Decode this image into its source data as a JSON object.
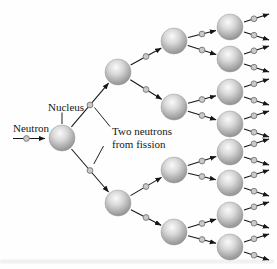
{
  "canvas": {
    "width": 277,
    "height": 269,
    "background": "#fefefe"
  },
  "labels": {
    "neutron": "Neutron",
    "nucleus": "Nucleus",
    "fission_line1": "Two neutrons",
    "fission_line2": "from fission"
  },
  "colors": {
    "arrow": "#161616",
    "text": "#161616",
    "sphere_highlight": "#fafafa",
    "sphere_light": "#d9d9d9",
    "sphere_mid": "#aeaeae",
    "sphere_edge": "#8b8b8b",
    "sphere_rim": "#9a9a9a",
    "neutron_dot_fill": "#c9c9c9",
    "neutron_dot_stroke": "#767676",
    "page_artifact": "#ececec"
  },
  "diagram": {
    "spheres": [
      {
        "id": "gen1",
        "generation": 1,
        "x": 62,
        "y": 138,
        "r": 13
      },
      {
        "id": "gen2a",
        "generation": 2,
        "x": 118,
        "y": 72,
        "r": 13
      },
      {
        "id": "gen2b",
        "generation": 2,
        "x": 118,
        "y": 203,
        "r": 13
      },
      {
        "id": "gen3a",
        "generation": 3,
        "x": 174,
        "y": 41,
        "r": 13
      },
      {
        "id": "gen3b",
        "generation": 3,
        "x": 174,
        "y": 107,
        "r": 13
      },
      {
        "id": "gen3c",
        "generation": 3,
        "x": 174,
        "y": 170,
        "r": 13
      },
      {
        "id": "gen3d",
        "generation": 3,
        "x": 174,
        "y": 232,
        "r": 13
      },
      {
        "id": "gen4a",
        "generation": 4,
        "x": 230,
        "y": 27,
        "r": 13
      },
      {
        "id": "gen4b",
        "generation": 4,
        "x": 230,
        "y": 59,
        "r": 13
      },
      {
        "id": "gen4c",
        "generation": 4,
        "x": 230,
        "y": 92,
        "r": 13
      },
      {
        "id": "gen4d",
        "generation": 4,
        "x": 230,
        "y": 124,
        "r": 13
      },
      {
        "id": "gen4e",
        "generation": 4,
        "x": 230,
        "y": 152,
        "r": 13
      },
      {
        "id": "gen4f",
        "generation": 4,
        "x": 230,
        "y": 183,
        "r": 13
      },
      {
        "id": "gen4g",
        "generation": 4,
        "x": 230,
        "y": 215,
        "r": 13
      },
      {
        "id": "gen4h",
        "generation": 4,
        "x": 230,
        "y": 247,
        "r": 13
      }
    ],
    "links": [
      {
        "from": "gen1",
        "to": "gen2a"
      },
      {
        "from": "gen1",
        "to": "gen2b"
      },
      {
        "from": "gen2a",
        "to": "gen3a"
      },
      {
        "from": "gen2a",
        "to": "gen3b"
      },
      {
        "from": "gen2b",
        "to": "gen3c"
      },
      {
        "from": "gen2b",
        "to": "gen3d"
      },
      {
        "from": "gen3a",
        "to": "gen4a"
      },
      {
        "from": "gen3a",
        "to": "gen4b"
      },
      {
        "from": "gen3b",
        "to": "gen4c"
      },
      {
        "from": "gen3b",
        "to": "gen4d"
      },
      {
        "from": "gen3c",
        "to": "gen4e"
      },
      {
        "from": "gen3c",
        "to": "gen4f"
      },
      {
        "from": "gen3d",
        "to": "gen4g"
      },
      {
        "from": "gen3d",
        "to": "gen4h"
      }
    ],
    "exit_sphere_ids": [
      "gen4a",
      "gen4b",
      "gen4c",
      "gen4d",
      "gen4e",
      "gen4f",
      "gen4g",
      "gen4h"
    ],
    "exit_arrow": {
      "start_dx": 14,
      "start_dy": 5,
      "end_dx": 39,
      "end_dy": 13,
      "dot_t": 0.4
    },
    "initial_arrow": {
      "x1": 13,
      "y1": 138.5,
      "x2": 45,
      "y2": 138.5,
      "dot_t": 0.42
    },
    "pointer_lines": [
      {
        "name": "nucleus-label-pointer",
        "x1": 62,
        "y1": 112.5,
        "x2": 62,
        "y2": 124
      },
      {
        "name": "fission-label-pointer-upper",
        "x1": 110,
        "y1": 126.5,
        "x2": 94.5,
        "y2": 107.5
      },
      {
        "name": "fission-label-pointer-lower",
        "x1": 103.5,
        "y1": 146,
        "x2": 93.8,
        "y2": 164
      }
    ],
    "neutron_dot_radius": 2.9,
    "link_dot_t": 0.5,
    "link_trim_extra": 1.5,
    "page_artifact": {
      "x": 0,
      "y": 259.5,
      "w": 274,
      "h": 4
    }
  }
}
